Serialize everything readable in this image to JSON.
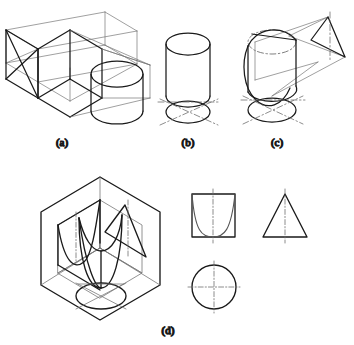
{
  "figure": {
    "type": "engineering-drawing",
    "background_color": "#ffffff",
    "line_color": "#1a1a1a",
    "thin_line_color": "#6f6f6f",
    "centerline_color": "#707070",
    "caption_color": "#3a3a3a",
    "panels": [
      {
        "id": "a",
        "caption": "(a)",
        "caption_x": 62,
        "caption_y": 146,
        "description": "Isometric box frame of three mutually perpendicular projection planes with a cylinder placed at the right end"
      },
      {
        "id": "b",
        "caption": "(b)",
        "caption_x": 188,
        "caption_y": 146,
        "description": "Upright cylinder with its horizontal projection ellipse and crossed dash-dot centrelines below"
      },
      {
        "id": "c",
        "caption": "(c)",
        "caption_x": 277,
        "caption_y": 146,
        "description": "Cylinder truncated by an inclined cutting plane, horizontal projection ellipse below, auxiliary triangular view at upper right"
      },
      {
        "id": "d",
        "caption": "(d)",
        "caption_x": 168,
        "caption_y": 334,
        "description": "Hexagonal isometric box of three planes containing a paraboloid solid, with three orthographic views at the right"
      }
    ],
    "orthographic_views": [
      {
        "name": "front-view-square-with-parabola",
        "shape": "square",
        "curve": "parabola",
        "centerline": "vertical"
      },
      {
        "name": "side-view-triangle",
        "shape": "triangle",
        "centerline": "vertical"
      },
      {
        "name": "top-view-circle",
        "shape": "circle",
        "centerline": "vertical-and-horizontal"
      }
    ]
  }
}
